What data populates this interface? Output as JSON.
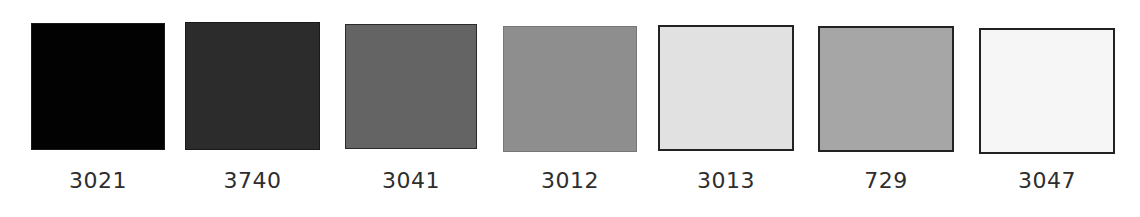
{
  "swatches": [
    {
      "code": "3021",
      "color": "#020202",
      "border": "#1a1a1a",
      "x": 31,
      "y": 23,
      "w": 134,
      "h": 127,
      "bw": 1
    },
    {
      "code": "3740",
      "color": "#2c2c2c",
      "border": "#1a1a1a",
      "x": 185,
      "y": 22,
      "w": 135,
      "h": 128,
      "bw": 1
    },
    {
      "code": "3041",
      "color": "#646464",
      "border": "#2a2a2a",
      "x": 345,
      "y": 24,
      "w": 132,
      "h": 125,
      "bw": 1
    },
    {
      "code": "3012",
      "color": "#8e8e8e",
      "border": "#777777",
      "x": 503,
      "y": 26,
      "w": 134,
      "h": 126,
      "bw": 1
    },
    {
      "code": "3013",
      "color": "#e1e1e1",
      "border": "#222222",
      "x": 658,
      "y": 25,
      "w": 136,
      "h": 126,
      "bw": 2
    },
    {
      "code": "729",
      "color": "#a6a6a6",
      "border": "#222222",
      "x": 818,
      "y": 26,
      "w": 136,
      "h": 126,
      "bw": 2
    },
    {
      "code": "3047",
      "color": "#f6f6f6",
      "border": "#222222",
      "x": 979,
      "y": 28,
      "w": 136,
      "h": 126,
      "bw": 2
    }
  ]
}
